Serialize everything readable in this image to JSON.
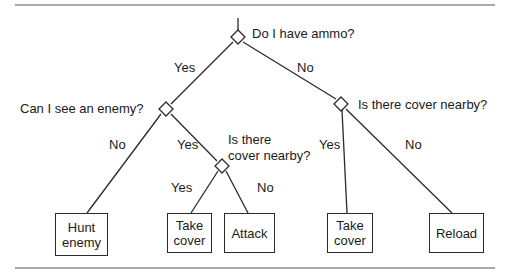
{
  "diagram": {
    "type": "decision-tree",
    "root": {
      "question": "Do I have ammo?",
      "yes": {
        "question": "Can I see an enemy?",
        "no": {
          "action": "Hunt enemy"
        },
        "yes": {
          "question_line1": "Is there",
          "question_line2": "cover nearby?",
          "yes": {
            "action_line1": "Take",
            "action_line2": "cover"
          },
          "no": {
            "action": "Attack"
          }
        }
      },
      "no": {
        "question": "Is there cover nearby?",
        "yes": {
          "action_line1": "Take",
          "action_line2": "cover"
        },
        "no": {
          "action": "Reload"
        }
      }
    },
    "edge_labels": {
      "yes": "Yes",
      "no": "No"
    },
    "colors": {
      "line": "#2a2a2a",
      "rule": "#555555",
      "background": "#ffffff"
    }
  }
}
